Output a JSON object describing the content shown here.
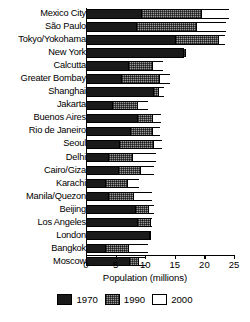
{
  "chart_data": {
    "type": "bar",
    "subtype": "stacked-horizontal",
    "title": "",
    "xlabel": "Population (millions)",
    "ylabel": "",
    "xlim": [
      0,
      25
    ],
    "xticks": [
      0,
      5,
      10,
      15,
      20,
      25
    ],
    "grid": false,
    "legend_position": "bottom",
    "categories": [
      "Mexico City",
      "São Paulo",
      "Tokyo/Yokohama",
      "New York",
      "Calcutta",
      "Greater Bombay",
      "Shanghai",
      "Jakarta",
      "Buenos Aires",
      "Rio de Janeiro",
      "Seoul",
      "Delhi",
      "Cairo/Giza",
      "Karachi",
      "Manila/Quezon",
      "Beijing",
      "Los Angeles",
      "London",
      "Bangkok",
      "Moscow"
    ],
    "series": [
      {
        "name": "1970",
        "color": "#1a1a1a",
        "values": [
          9.1,
          8.2,
          14.9,
          16.3,
          7.0,
          5.8,
          11.2,
          4.3,
          8.4,
          7.2,
          5.4,
          3.5,
          5.3,
          3.1,
          3.5,
          8.1,
          8.4,
          10.5,
          3.1,
          7.1
        ]
      },
      {
        "name": "1990",
        "color": "#9a9a9a",
        "values": [
          10.1,
          10.2,
          7.3,
          0.2,
          4.0,
          6.4,
          0.8,
          4.2,
          2.6,
          3.7,
          5.8,
          4.1,
          3.6,
          3.7,
          4.3,
          2.2,
          2.3,
          0.2,
          3.8,
          1.5
        ]
      },
      {
        "name": "2000",
        "color": "#ffffff",
        "values": [
          4.9,
          5.2,
          1.3,
          0.1,
          2.0,
          2.0,
          1.2,
          2.0,
          1.6,
          1.6,
          1.6,
          4.3,
          2.6,
          2.2,
          3.4,
          1.2,
          0.4,
          0.3,
          3.6,
          1.5
        ]
      }
    ],
    "totals": [
      24.1,
      23.6,
      23.5,
      16.6,
      13.0,
      14.2,
      13.2,
      10.5,
      12.6,
      12.5,
      12.8,
      11.9,
      11.5,
      9.0,
      11.2,
      11.5,
      11.1,
      11.0,
      10.5,
      10.1
    ]
  },
  "axis": {
    "x_title": "Population (millions)",
    "tick_labels": [
      "0",
      "5",
      "10",
      "15",
      "20",
      "25"
    ]
  },
  "legend": {
    "items": [
      {
        "label": "1970",
        "swatch": "black-swatch"
      },
      {
        "label": "1990",
        "swatch": "gray-hatched-swatch"
      },
      {
        "label": "2000",
        "swatch": "white-swatch"
      }
    ]
  }
}
